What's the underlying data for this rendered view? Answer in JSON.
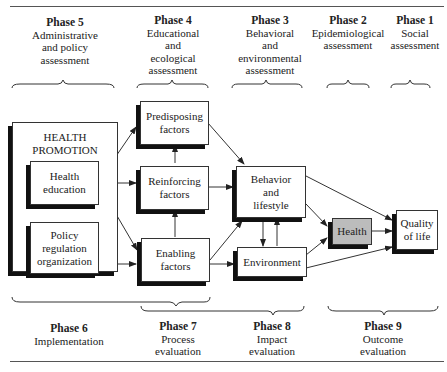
{
  "top_phases": [
    {
      "phase": "Phase 5",
      "desc": [
        "Administrative",
        "and policy",
        "assessment"
      ]
    },
    {
      "phase": "Phase 4",
      "desc": [
        "Educational",
        "and",
        "ecological",
        "assessment"
      ]
    },
    {
      "phase": "Phase 3",
      "desc": [
        "Behavioral",
        "and",
        "environmental",
        "assessment"
      ]
    },
    {
      "phase": "Phase 2",
      "desc": [
        "Epidemiological",
        "assessment"
      ]
    },
    {
      "phase": "Phase 1",
      "desc": [
        "Social",
        "assessment"
      ]
    }
  ],
  "bottom_phases": [
    {
      "phase": "Phase 6",
      "desc": [
        "Implementation"
      ]
    },
    {
      "phase": "Phase 7",
      "desc": [
        "Process",
        "evaluation"
      ]
    },
    {
      "phase": "Phase 8",
      "desc": [
        "Impact",
        "evaluation"
      ]
    },
    {
      "phase": "Phase 9",
      "desc": [
        "Outcome",
        "evaluation"
      ]
    }
  ],
  "health_promotion": {
    "title": [
      "HEALTH",
      "PROMOTION"
    ],
    "health_education": [
      "Health",
      "education"
    ],
    "policy": [
      "Policy",
      "regulation",
      "organization"
    ]
  },
  "factors": {
    "predisposing": [
      "Predisposing",
      "factors"
    ],
    "reinforcing": [
      "Reinforcing",
      "factors"
    ],
    "enabling": [
      "Enabling",
      "factors"
    ]
  },
  "behavior": [
    "Behavior",
    "and",
    "lifestyle"
  ],
  "environment": [
    "Environment"
  ],
  "health": [
    "Health"
  ],
  "quality_of_life": [
    "Quality",
    "of life"
  ],
  "colors": {
    "health_box": "#bcbcbc",
    "shadow": "#111111",
    "line": "#333333"
  }
}
